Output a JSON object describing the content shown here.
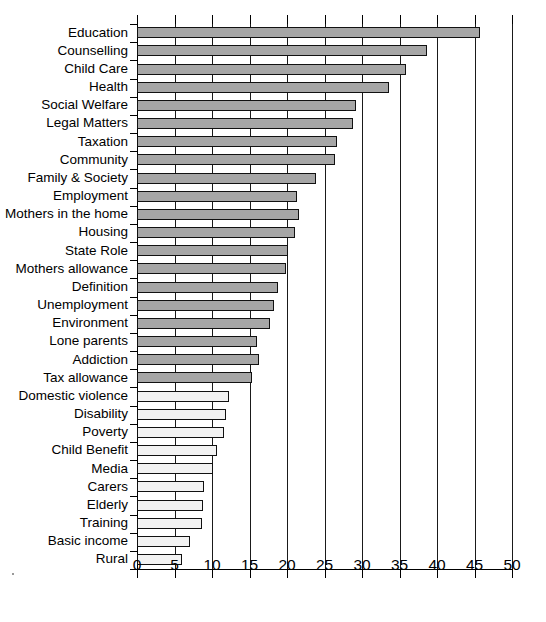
{
  "chart_data": {
    "type": "bar",
    "orientation": "horizontal",
    "title": "",
    "subtitle": "",
    "xlabel": "",
    "ylabel": "",
    "xlim": [
      0,
      50
    ],
    "xticks": [
      0,
      5,
      10,
      15,
      20,
      25,
      30,
      35,
      40,
      45,
      50
    ],
    "xtick_labels": [
      "0",
      "5",
      "10",
      "15",
      "20",
      "25",
      "30",
      "35",
      "40",
      "45",
      "50"
    ],
    "grid": "vertical",
    "legend": "none",
    "bar_fill_light": "#f2f2f2",
    "bar_fill_dark": "#a6a6a6",
    "bar_edge": "#111111",
    "axis_color": "#000000",
    "categories": [
      "Education",
      "Counselling",
      "Child Care",
      "Health",
      "Social Welfare",
      "Legal Matters",
      "Taxation",
      "Community",
      "Family & Society",
      "Employment",
      "Mothers in the home",
      "Housing",
      "State Role",
      "Mothers allowance",
      "Definition",
      "Unemployment",
      "Environment",
      "Lone parents",
      "Addiction",
      "Tax allowance",
      "Domestic violence",
      "Disability",
      "Poverty",
      "Child Benefit",
      "Media",
      "Carers",
      "Elderly",
      "Training",
      "Basic income",
      "Rural"
    ],
    "values": [
      45.7,
      38.6,
      35.9,
      33.6,
      29.2,
      28.8,
      26.7,
      26.4,
      23.9,
      21.3,
      21.6,
      21.1,
      20.1,
      19.8,
      18.8,
      18.3,
      17.7,
      16.0,
      16.3,
      15.3,
      12.3,
      11.9,
      11.6,
      10.7,
      10.1,
      8.9,
      8.8,
      8.7,
      7.0,
      6.0
    ],
    "bar_shades": [
      "dark",
      "dark",
      "dark",
      "dark",
      "dark",
      "dark",
      "dark",
      "dark",
      "dark",
      "dark",
      "dark",
      "dark",
      "dark",
      "dark",
      "dark",
      "dark",
      "dark",
      "dark",
      "dark",
      "dark",
      "light",
      "light",
      "light",
      "light",
      "light",
      "light",
      "light",
      "light",
      "light",
      "light"
    ]
  }
}
